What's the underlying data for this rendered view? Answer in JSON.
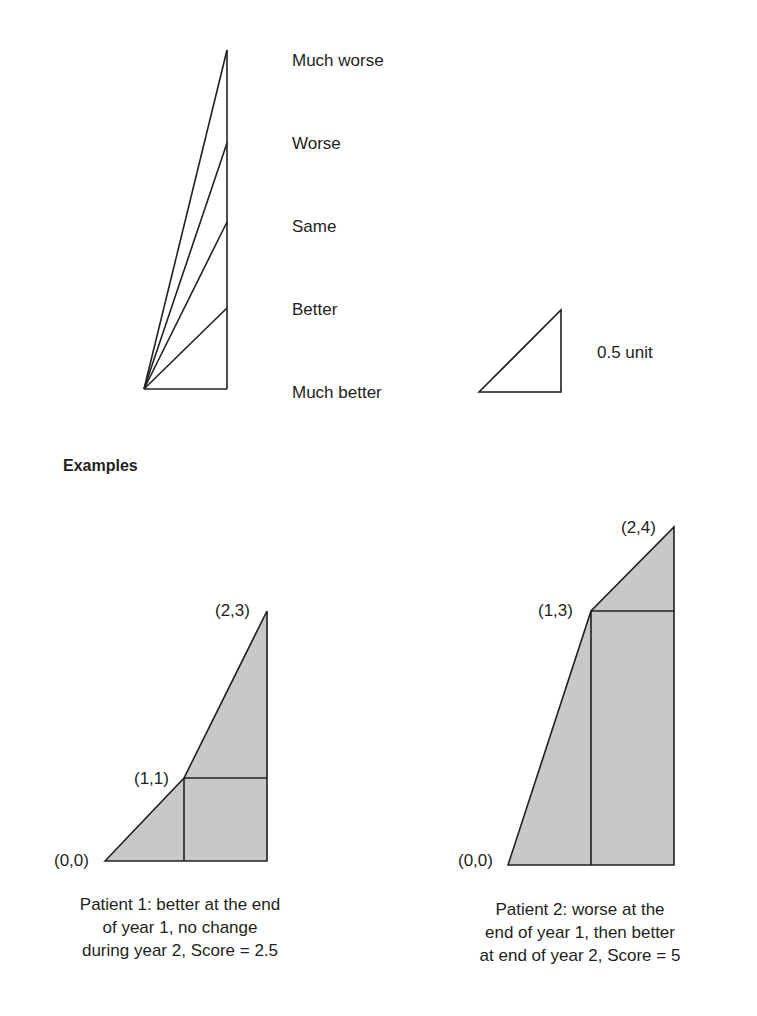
{
  "scale": {
    "labels": [
      "Much worse",
      "Worse",
      "Same",
      "Better",
      "Much better"
    ],
    "unit_label": "0.5 unit"
  },
  "examples": {
    "heading": "Examples",
    "patient1": {
      "points": [
        "(0,0)",
        "(1,1)",
        "(2,3)"
      ],
      "caption": [
        "Patient 1: better at the end",
        "of year 1, no change",
        "during year 2, Score = 2.5"
      ],
      "score": 2.5
    },
    "patient2": {
      "points": [
        "(0,0)",
        "(1,3)",
        "(2,4)"
      ],
      "caption": [
        "Patient 2: worse at the",
        "end of year 1, then better",
        "at end of year 2, Score = 5"
      ],
      "score": 5
    }
  },
  "colors": {
    "line": "#231f20",
    "fill": "#c8c8c8"
  }
}
